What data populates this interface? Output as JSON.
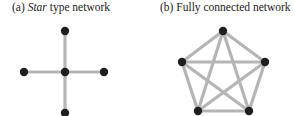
{
  "panels": [
    {
      "id": "a",
      "caption_prefix": "(a) ",
      "caption_italic": "Star",
      "caption_suffix": " type network",
      "nodes": [
        {
          "name": "center",
          "x": 65,
          "y": 72
        },
        {
          "name": "top",
          "x": 65,
          "y": 31
        },
        {
          "name": "left",
          "x": 24,
          "y": 72
        },
        {
          "name": "right",
          "x": 104,
          "y": 72
        },
        {
          "name": "bottom",
          "x": 65,
          "y": 113
        }
      ],
      "edges": [
        [
          0,
          1
        ],
        [
          0,
          2
        ],
        [
          0,
          3
        ],
        [
          0,
          4
        ]
      ]
    },
    {
      "id": "b",
      "caption": "(b) Fully connected network",
      "nodes": [
        {
          "name": "top",
          "x": 223,
          "y": 31
        },
        {
          "name": "left",
          "x": 182,
          "y": 62
        },
        {
          "name": "right",
          "x": 265,
          "y": 62
        },
        {
          "name": "bottom-left",
          "x": 198,
          "y": 111
        },
        {
          "name": "bottom-right",
          "x": 249,
          "y": 111
        }
      ],
      "edges": [
        [
          0,
          1
        ],
        [
          0,
          2
        ],
        [
          0,
          3
        ],
        [
          0,
          4
        ],
        [
          1,
          2
        ],
        [
          1,
          3
        ],
        [
          1,
          4
        ],
        [
          2,
          3
        ],
        [
          2,
          4
        ],
        [
          3,
          4
        ]
      ]
    }
  ],
  "colors": {
    "edge": "#b5b5b5",
    "node": "#1f1f1f"
  }
}
